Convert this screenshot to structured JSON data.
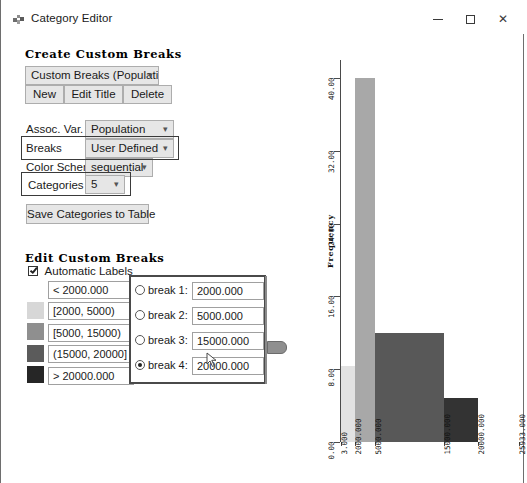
{
  "window": {
    "title": "Category Editor",
    "icon": "app-icon",
    "minimize_label": "Minimize",
    "maximize_label": "Maximize",
    "close_label": "Close"
  },
  "create_section": {
    "header": "Create Custom Breaks",
    "breaks_selector": {
      "value": "Custom Breaks (Population)"
    },
    "buttons": [
      {
        "label": "New"
      },
      {
        "label": "Edit Title"
      },
      {
        "label": "Delete"
      }
    ],
    "fields": [
      {
        "label": "Assoc. Var.",
        "value": "Population",
        "highlighted": false
      },
      {
        "label": "Breaks",
        "value": "User Defined",
        "highlighted": true
      },
      {
        "label": "Color Scheme",
        "value": "sequential",
        "highlighted": false
      },
      {
        "label": "Categories",
        "value": "5",
        "highlighted": true
      }
    ],
    "save_button": "Save Categories to Table"
  },
  "edit_section": {
    "header": "Edit Custom Breaks",
    "automatic_labels": {
      "label": "Automatic Labels",
      "checked": true
    },
    "categories": [
      {
        "label": "< 2000.000",
        "color": "#fafafa"
      },
      {
        "label": "[2000, 5000)",
        "color": "#d7d7d7"
      },
      {
        "label": "[5000, 15000)",
        "color": "#8f8f8f"
      },
      {
        "label": "(15000, 20000]",
        "color": "#5b5b5b"
      },
      {
        "label": "> 20000.000",
        "color": "#262626"
      }
    ],
    "breaks": [
      {
        "label": "break 1:",
        "value": "2000.000",
        "selected": false
      },
      {
        "label": "break 2:",
        "value": "5000.000",
        "selected": false
      },
      {
        "label": "break 3:",
        "value": "15000.000",
        "selected": false
      },
      {
        "label": "break 4:",
        "value": "20000.000",
        "selected": true
      }
    ],
    "slider_name": "break-slider"
  },
  "chart_data": {
    "type": "bar",
    "title": "",
    "xlabel": "",
    "ylabel": "Frequency",
    "grid": false,
    "legend": "none",
    "ylim": [
      0,
      42
    ],
    "yticks": [
      "0.00",
      "8.00",
      "16.00",
      "24.00",
      "32.00",
      "40.00"
    ],
    "ytick_values": [
      0,
      8,
      16,
      24,
      32,
      40
    ],
    "xticks": [
      "3.000",
      "2000.000",
      "5000.000",
      "15000.000",
      "20000.000",
      "25933.000"
    ],
    "xtick_values": [
      3,
      2000,
      5000,
      15000,
      20000,
      25933
    ],
    "categories": [
      "< 2000",
      "[2000, 5000)",
      "[5000, 15000)",
      "(15000, 20000]",
      "> 20000"
    ],
    "values": [
      8.4,
      40,
      12,
      4.8,
      0
    ],
    "bars": [
      {
        "label": "< 2000",
        "value": 8.4,
        "color": "#e2e2e2"
      },
      {
        "label": "[2000, 5000)",
        "value": 40,
        "color": "#a8a8a8"
      },
      {
        "label": "[5000, 15000)",
        "value": 12,
        "color": "#585858"
      },
      {
        "label": "(15000, 20000]",
        "value": 4.8,
        "color": "#333333"
      }
    ]
  }
}
